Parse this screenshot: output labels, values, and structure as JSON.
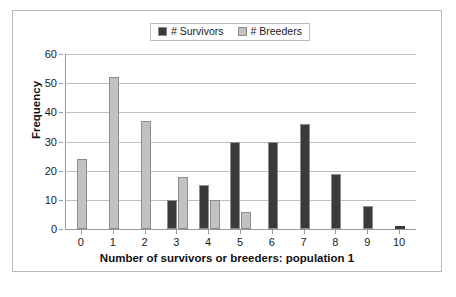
{
  "chart_data": {
    "type": "bar",
    "title": "",
    "xlabel": "Number of survivors or breeders: population 1",
    "ylabel": "Frequency",
    "categories": [
      "0",
      "1",
      "2",
      "3",
      "4",
      "5",
      "6",
      "7",
      "8",
      "9",
      "10"
    ],
    "series": [
      {
        "name": "# Survivors",
        "color": "#3a3a3a",
        "values": [
          0,
          0,
          0,
          10,
          15,
          30,
          30,
          36,
          19,
          8,
          1
        ]
      },
      {
        "name": "# Breeders",
        "color": "#c2c2c2",
        "values": [
          24,
          52,
          37,
          18,
          10,
          6,
          0,
          0,
          0,
          0,
          0
        ]
      }
    ],
    "ylim": [
      0,
      60
    ],
    "y_ticks": [
      0,
      10,
      20,
      30,
      40,
      50,
      60
    ],
    "grid": true,
    "legend_position": "top-center"
  },
  "legend": {
    "entries": [
      {
        "label": "# Survivors",
        "color": "#3a3a3a"
      },
      {
        "label": "# Breeders",
        "color": "#c2c2c2"
      }
    ]
  },
  "axes": {
    "y_title": "Frequency",
    "x_title": "Number of survivors or breeders: population 1",
    "y_tick_labels": [
      "60",
      "50",
      "40",
      "30",
      "20",
      "10",
      "0"
    ],
    "x_tick_labels": [
      "0",
      "1",
      "2",
      "3",
      "4",
      "5",
      "6",
      "7",
      "8",
      "9",
      "10"
    ]
  },
  "colors": {
    "survivors": "#3a3a3a",
    "breeders": "#c2c2c2",
    "gridline": "#bfbfbf",
    "axis": "#9a9a9a",
    "frame": "#b9b9b9"
  }
}
